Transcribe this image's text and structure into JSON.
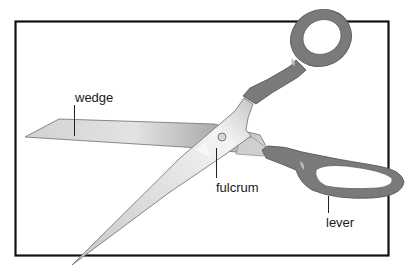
{
  "diagram": {
    "labels": {
      "wedge": "wedge",
      "fulcrum": "fulcrum",
      "lever": "lever"
    },
    "colors": {
      "frame": "#111111",
      "handle": "#7a7a7a",
      "handle_dark": "#5e5e5e",
      "blade_light": "#e6e6e6",
      "blade_mid": "#bdbdbd",
      "blade_dark": "#8f8f8f",
      "background": "#ffffff"
    }
  }
}
